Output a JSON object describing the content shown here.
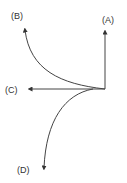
{
  "diagram": {
    "title": "",
    "stroke_color": "#444444",
    "paths": [
      {
        "id": "A",
        "label": "(A)",
        "shape": "straight",
        "direction": "up"
      },
      {
        "id": "B",
        "label": "(B)",
        "shape": "curve",
        "direction": "up-left"
      },
      {
        "id": "C",
        "label": "(C)",
        "shape": "straight",
        "direction": "left"
      },
      {
        "id": "D",
        "label": "(D)",
        "shape": "curve",
        "direction": "down-left"
      }
    ]
  }
}
